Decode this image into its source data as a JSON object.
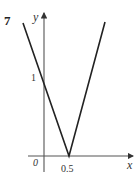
{
  "question_number": "7",
  "axes": {
    "x_label": "x",
    "y_label": "y",
    "origin_label": "0"
  },
  "annotations": {
    "y_intercept": "1",
    "x_vertex": "0.5"
  },
  "graph": {
    "description": "V-shaped graph y = |2x - 1| with vertex at (0.5, 0) and y-intercept 1",
    "line_color": "#222222",
    "axis_color": "#555555"
  }
}
